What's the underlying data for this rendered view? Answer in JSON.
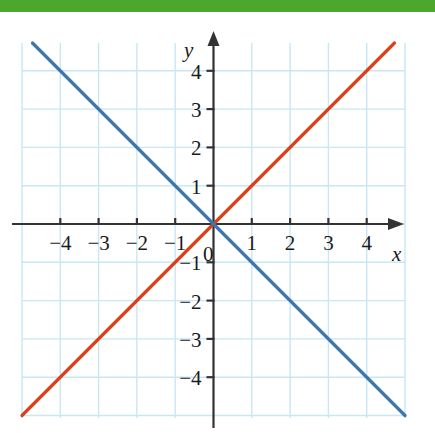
{
  "page": {
    "top_band_color": "#4ca72c"
  },
  "figure": {
    "background": "#ffffff",
    "grid_color": "#c9e6f5",
    "axis_color": "#333333",
    "axis_labels": {
      "x": "x",
      "y": "y"
    },
    "origin_label": "0"
  },
  "chart_data": {
    "type": "line",
    "title": "",
    "xlabel": "x",
    "ylabel": "y",
    "xlim": [
      -5,
      5
    ],
    "ylim": [
      -5,
      5
    ],
    "grid": true,
    "legend": "none",
    "x_ticks": [
      -4,
      -3,
      -2,
      -1,
      1,
      2,
      3,
      4
    ],
    "y_ticks": [
      4,
      3,
      2,
      1,
      -1,
      -2,
      -3,
      -4
    ],
    "x_tick_labels": [
      "−4",
      "−3",
      "−2",
      "−1",
      "1",
      "2",
      "3",
      "4"
    ],
    "y_tick_labels": [
      "4",
      "3",
      "2",
      "1",
      "−1",
      "−2",
      "−3",
      "−4"
    ],
    "origin_label": "0",
    "series": [
      {
        "name": "y = x",
        "color": "#d8421a",
        "equation": "y = x",
        "slope": 1,
        "intercept": 0,
        "x": [
          -5,
          5
        ],
        "values": [
          -5,
          5
        ]
      },
      {
        "name": "y = -x",
        "color": "#3a77b0",
        "equation": "y = −x",
        "slope": -1,
        "intercept": 0,
        "x": [
          -5,
          5
        ],
        "values": [
          5,
          -5
        ]
      }
    ]
  }
}
